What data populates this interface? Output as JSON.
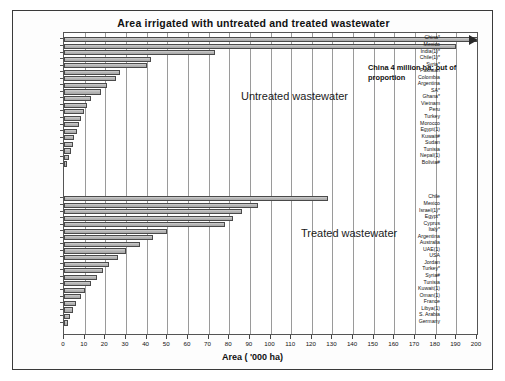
{
  "chart_data": {
    "type": "bar",
    "title": "Area irrigated with untreated and treated wastewater",
    "xlabel": "Area ( '000 ha)",
    "ylabel": "",
    "orientation": "horizontal",
    "xlim": [
      0,
      200
    ],
    "xticks": [
      0,
      10,
      20,
      30,
      40,
      50,
      60,
      70,
      80,
      90,
      100,
      110,
      120,
      130,
      140,
      150,
      160,
      170,
      180,
      190,
      200
    ],
    "grid": true,
    "legend": "none",
    "annotations": [
      {
        "text": "China 4 million ha; out of proportion",
        "note": "China bar is truncated with an arrow at the right edge"
      }
    ],
    "panels": [
      {
        "name": "Untreated wastewater",
        "label": "Untreated wastewater",
        "categories": [
          "China*",
          "Mexico",
          "India(1)*",
          "Chile(1)*",
          "Syria*",
          "Pakistan",
          "Colombia",
          "Argentina",
          "SA*",
          "Ghana*",
          "Vietnam",
          "Peru",
          "Turkey",
          "Morocco",
          "Egypt(1)",
          "Kuwait#",
          "Sudan",
          "Tunisia",
          "Nepal(1)",
          "Bolivia#"
        ],
        "values": [
          200,
          190,
          73,
          42,
          40,
          27,
          25,
          21,
          18,
          13,
          11,
          9.5,
          8,
          7.5,
          6.5,
          5,
          4.5,
          3.5,
          2.5,
          1.5
        ],
        "value_notes": "China is plotted off-scale (4 million ha) and shown clipped with an arrow"
      },
      {
        "name": "Treated wastewater",
        "label": "Treated wastewater",
        "categories": [
          "Chile",
          "Mexico",
          "Israel(1)*",
          "Egypt*",
          "Cyprus",
          "Italy*",
          "Argentina",
          "Australia",
          "UAE(1)",
          "USA",
          "Jordan",
          "Turkey*",
          "Syria#",
          "Tunisia",
          "Kuwait(1)",
          "Oman(1)",
          "France",
          "Libya(1)",
          "S. Arabia",
          "Germany"
        ],
        "values": [
          128,
          94,
          86,
          82,
          78,
          50,
          43,
          37,
          30,
          26,
          22,
          19,
          16,
          13,
          10,
          8,
          6,
          4.5,
          3,
          2
        ]
      }
    ]
  },
  "labels": {
    "untreated_section": "Untreated wastewater",
    "treated_section": "Treated wastewater",
    "annotation": "China 4 million ha; out of proportion",
    "xaxis_title": "Area ( '000 ha)"
  }
}
